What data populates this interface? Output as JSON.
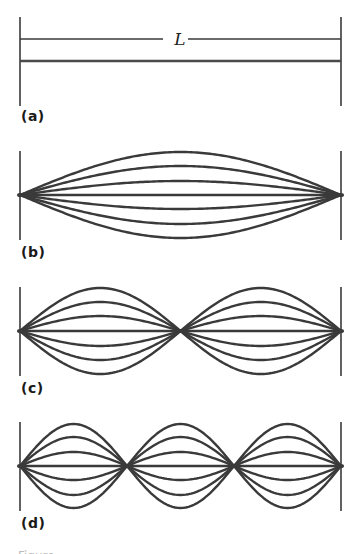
{
  "figure": {
    "stroke_color": "#3a3a3a",
    "string_color": "#4a4a4a",
    "x_left": 20,
    "x_right": 341,
    "length_symbol": "L",
    "panels": [
      {
        "id": "a",
        "label": "(a)",
        "harmonic": 0,
        "description": "String at rest with length dimension L",
        "bar_top": 17,
        "bar_bottom": 106,
        "center_y": 61,
        "dimension_y": 39,
        "label_y": 108,
        "amplitudes": []
      },
      {
        "id": "b",
        "label": "(b)",
        "harmonic": 1,
        "loops": 1,
        "description": "Fundamental mode, one loop",
        "bar_top": 151,
        "bar_bottom": 240,
        "center_y": 195,
        "label_y": 244,
        "amplitudes": [
          43,
          29,
          14,
          0,
          -14,
          -29,
          -43
        ]
      },
      {
        "id": "c",
        "label": "(c)",
        "harmonic": 2,
        "loops": 2,
        "description": "Second harmonic, two loops, one interior node",
        "bar_top": 287,
        "bar_bottom": 376,
        "center_y": 331,
        "label_y": 380,
        "amplitudes": [
          43,
          29,
          15,
          0,
          -15,
          -29,
          -43
        ]
      },
      {
        "id": "d",
        "label": "(d)",
        "harmonic": 3,
        "loops": 3,
        "description": "Third harmonic, three loops, two interior nodes",
        "bar_top": 422,
        "bar_bottom": 511,
        "center_y": 466,
        "label_y": 515,
        "amplitudes": [
          42,
          29,
          14,
          0,
          -14,
          -29,
          -42
        ]
      }
    ]
  },
  "caption": {
    "visible_fragment": "Figure"
  }
}
